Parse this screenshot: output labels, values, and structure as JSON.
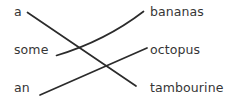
{
  "exercise": {
    "type": "matching-lines",
    "background_color": "#ffffff",
    "text_color": "#363636",
    "line_color": "#2b2b2b",
    "left_column": [
      {
        "id": "a",
        "label": "a"
      },
      {
        "id": "some",
        "label": "some"
      },
      {
        "id": "an",
        "label": "an"
      }
    ],
    "right_column": [
      {
        "id": "bananas",
        "label": "bananas"
      },
      {
        "id": "octopus",
        "label": "octopus"
      },
      {
        "id": "tambourine",
        "label": "tambourine"
      }
    ],
    "connections": [
      {
        "from": "a",
        "to": "tambourine",
        "path": "M 27.5 12.5 L 136 86",
        "curved": false
      },
      {
        "from": "some",
        "to": "bananas",
        "path": "M 56.5 55.5 Q 105 41 143.5 11.5",
        "curved": true
      },
      {
        "from": "an",
        "to": "octopus",
        "path": "M 40 95 L 147 48",
        "curved": false
      }
    ]
  }
}
